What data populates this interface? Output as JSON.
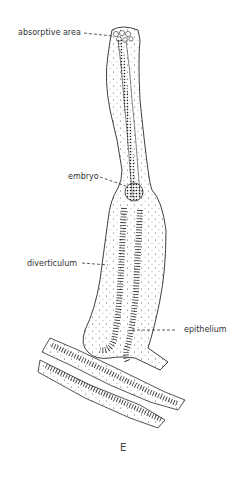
{
  "figure": {
    "panel_label": "E",
    "labels": {
      "absorptive_area": "absorptive area",
      "embryo": "embryo",
      "diverticulum": "diverticulum",
      "epithelium": "epithelium"
    }
  },
  "colors": {
    "line": "#2a2a2a",
    "stipple": "#555555",
    "background": "#ffffff"
  }
}
